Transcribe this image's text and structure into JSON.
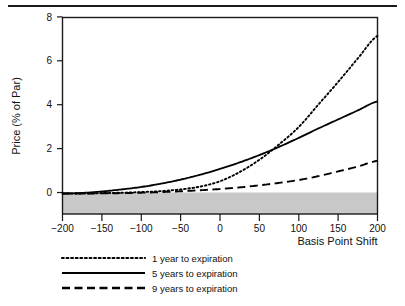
{
  "chart_data": {
    "type": "line",
    "title": "",
    "xlabel": "Basis Point Shift",
    "ylabel": "Price (% of Par)",
    "xlim": [
      -200,
      200
    ],
    "ylim": [
      -1,
      8.6
    ],
    "xticks": [
      -200,
      -150,
      -100,
      -50,
      0,
      50,
      100,
      150,
      200
    ],
    "xticklabels": [
      "−200",
      "−150",
      "−100",
      "−50",
      "0",
      "50",
      "100",
      "150",
      "200"
    ],
    "yticks": [
      0,
      2,
      4,
      6,
      8
    ],
    "yticklabels": [
      "0",
      "2",
      "4",
      "6",
      "8"
    ],
    "grid": false,
    "legend_position": "below-plot",
    "shaded_band": {
      "label": "negative-price-region",
      "y_from": -1,
      "y_to": 0,
      "color": "#c8c8c8"
    },
    "x": [
      -200,
      -175,
      -150,
      -125,
      -100,
      -75,
      -50,
      -25,
      0,
      25,
      50,
      75,
      100,
      125,
      150,
      175,
      200
    ],
    "series": [
      {
        "name": "1 year to expiration",
        "style": "dotted",
        "color": "#000000",
        "values": [
          0.0,
          0.0,
          0.02,
          0.04,
          0.07,
          0.12,
          0.2,
          0.34,
          0.6,
          1.05,
          1.65,
          2.4,
          3.25,
          4.35,
          5.45,
          6.6,
          7.7
        ]
      },
      {
        "name": "5 years to expiration",
        "style": "solid",
        "color": "#000000",
        "values": [
          0.0,
          0.03,
          0.1,
          0.2,
          0.32,
          0.48,
          0.68,
          0.92,
          1.2,
          1.52,
          1.88,
          2.28,
          2.72,
          3.18,
          3.62,
          4.06,
          4.5
        ]
      },
      {
        "name": "9 years to expiration",
        "style": "dashed",
        "color": "#000000",
        "values": [
          0.0,
          0.0,
          0.01,
          0.02,
          0.04,
          0.07,
          0.11,
          0.16,
          0.22,
          0.3,
          0.4,
          0.52,
          0.66,
          0.85,
          1.08,
          1.32,
          1.6
        ]
      }
    ],
    "legend": [
      {
        "label": "1 year to expiration",
        "style": "dotted"
      },
      {
        "label": "5 years to expiration",
        "style": "solid"
      },
      {
        "label": "9 years to expiration",
        "style": "dashed"
      }
    ]
  }
}
